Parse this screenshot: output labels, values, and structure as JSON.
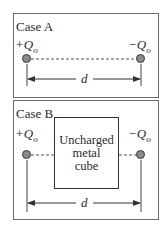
{
  "case_a": {
    "title": "Case A",
    "left_charge": {
      "sign": "+",
      "symbol": "Q",
      "subscript": "o"
    },
    "right_charge": {
      "sign": "−",
      "symbol": "Q",
      "subscript": "o"
    },
    "distance_label": "d"
  },
  "case_b": {
    "title": "Case B",
    "left_charge": {
      "sign": "+",
      "symbol": "Q",
      "subscript": "o"
    },
    "right_charge": {
      "sign": "−",
      "symbol": "Q",
      "subscript": "o"
    },
    "cube_label_lines": [
      "Uncharged",
      "metal",
      "cube"
    ],
    "distance_label": "d"
  },
  "colors": {
    "charge_fill": "#8a8a8a",
    "line": "#333333",
    "border": "#6a6a6a"
  }
}
